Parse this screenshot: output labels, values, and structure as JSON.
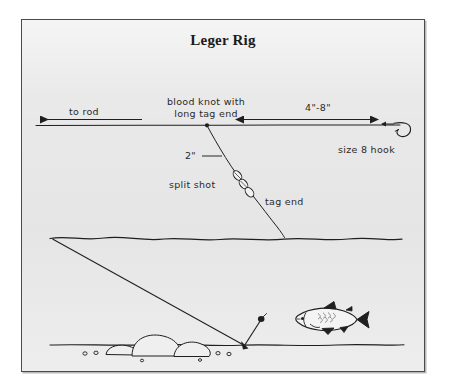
{
  "figure": {
    "title": "Leger Rig",
    "panel_bg": "#e9e9e9",
    "border_color": "#4a4a4a",
    "ink_color": "#1f1f1f"
  },
  "labels": {
    "to_rod": "to rod",
    "blood_knot_line1": "blood knot with",
    "blood_knot_line2": "long tag end",
    "distance_hook": "4\"-8\"",
    "size_8_hook": "size 8 hook",
    "two_inch": "2\"",
    "split_shot": "split shot",
    "tag_end": "tag end"
  },
  "diagram_elements": {
    "main_line": "horizontal-fishing-line",
    "hook": "size-8-hook",
    "split_shot_count": 3,
    "water_surface": "wavy-water-surface-line",
    "riverbed": "riverbed-line",
    "rocks": 3,
    "pebbles": 6,
    "fish": "fish-facing-left",
    "bottom_hook": "baited-hook-on-bottom"
  }
}
